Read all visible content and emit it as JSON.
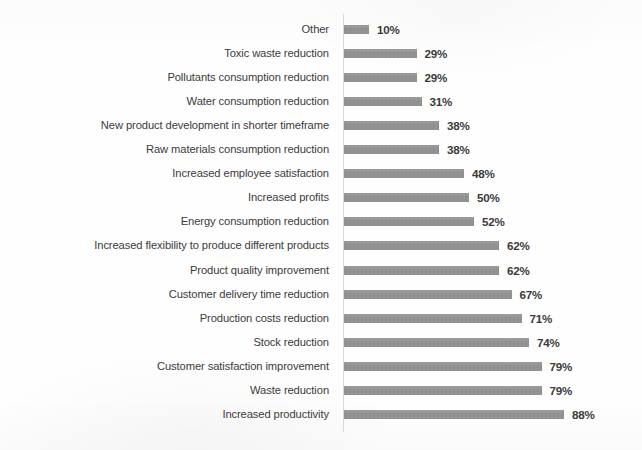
{
  "chart_data": {
    "type": "bar",
    "orientation": "horizontal",
    "title": "",
    "subtitle": "",
    "xlabel": "",
    "ylabel": "",
    "xlim": [
      0,
      100
    ],
    "grid": false,
    "legend": null,
    "value_suffix": "%",
    "bar_color": "#8c8c8c",
    "label_color": "#3b3b3b",
    "background": "#fefefe",
    "categories": [
      "Other",
      "Toxic waste reduction",
      "Pollutants consumption reduction",
      "Water consumption reduction",
      "New product development in shorter timeframe",
      "Raw materials consumption reduction",
      "Increased employee satisfaction",
      "Increased profits",
      "Energy consumption reduction",
      "Increased flexibility to produce different products",
      "Product quality improvement",
      "Customer delivery time reduction",
      "Production costs reduction",
      "Stock reduction",
      "Customer satisfaction improvement",
      "Waste reduction",
      "Increased productivity"
    ],
    "values": [
      10,
      29,
      29,
      31,
      38,
      38,
      48,
      50,
      52,
      62,
      62,
      67,
      71,
      74,
      79,
      79,
      88
    ],
    "value_labels": [
      "10%",
      "29%",
      "29%",
      "31%",
      "38%",
      "38%",
      "48%",
      "50%",
      "52%",
      "62%",
      "62%",
      "67%",
      "71%",
      "74%",
      "79%",
      "79%",
      "88%"
    ]
  }
}
